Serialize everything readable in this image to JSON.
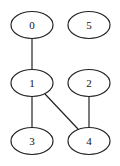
{
  "graph": {
    "nodes": [
      {
        "id": "0",
        "label": "0",
        "x": 32,
        "y": 25
      },
      {
        "id": "5",
        "label": "5",
        "x": 89,
        "y": 25
      },
      {
        "id": "1",
        "label": "1",
        "x": 32,
        "y": 83
      },
      {
        "id": "2",
        "label": "2",
        "x": 89,
        "y": 83
      },
      {
        "id": "3",
        "label": "3",
        "x": 32,
        "y": 141
      },
      {
        "id": "4",
        "label": "4",
        "x": 89,
        "y": 141
      }
    ],
    "edges": [
      {
        "from": "0",
        "to": "1"
      },
      {
        "from": "1",
        "to": "3"
      },
      {
        "from": "1",
        "to": "4"
      },
      {
        "from": "2",
        "to": "4"
      }
    ]
  }
}
